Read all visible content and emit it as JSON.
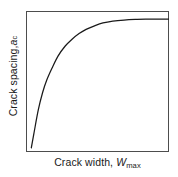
{
  "figure": {
    "background_color": "#ffffff",
    "frame_color": "#4d4d4d",
    "curve_color": "#1a1a1a"
  },
  "axes": {
    "ylabel_prefix": "Crack spacing, ",
    "ylabel_var": "a",
    "ylabel_sub": "c",
    "xlabel_prefix": "Crack width, ",
    "xlabel_var": "W",
    "xlabel_sub": "max"
  },
  "chart_data": {
    "type": "line",
    "title": "",
    "subtitle": "",
    "xlabel": "Crack width, Wmax",
    "ylabel": "Crack spacing, ac",
    "xlim": [
      0,
      100
    ],
    "ylim": [
      0,
      100
    ],
    "grid": false,
    "legend": null,
    "tick_labels": {
      "x": [],
      "y": []
    },
    "annotations": [],
    "series": [
      {
        "name": "crack spacing vs crack width",
        "description": "steeply rising saturating curve reaching a horizontal plateau",
        "x": [
          2,
          4,
          7,
          10,
          13,
          17,
          21,
          26,
          31,
          36,
          41,
          47,
          53,
          60,
          68,
          76,
          85,
          92,
          100
        ],
        "y": [
          3,
          14,
          30,
          42,
          51,
          60,
          68,
          75,
          80,
          84,
          87,
          89.5,
          91.5,
          92.8,
          93.6,
          94,
          94.2,
          94.3,
          94.3
        ]
      }
    ]
  }
}
